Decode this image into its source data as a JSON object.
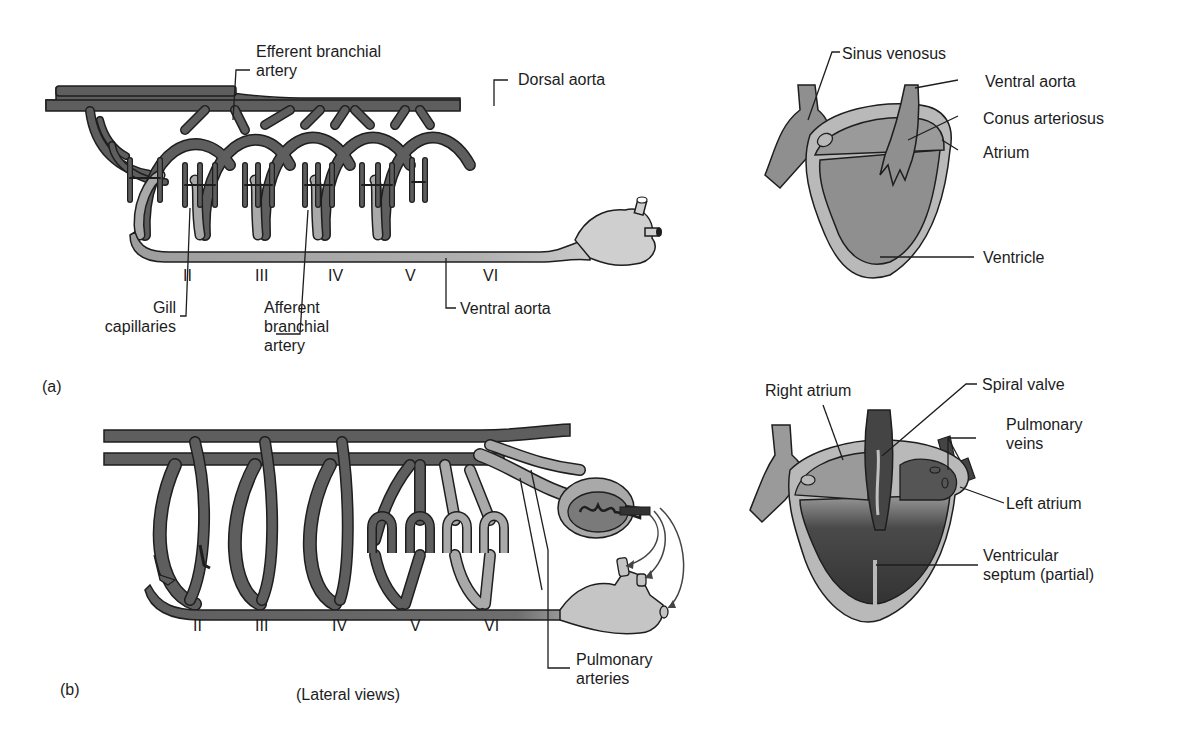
{
  "figure": {
    "caption": "(Lateral views)",
    "panels": [
      {
        "id": "a",
        "tag": "(a)",
        "arch_numerals": [
          "II",
          "III",
          "IV",
          "V",
          "VI"
        ],
        "arch_labels": {
          "efferent": "Efferent branchial artery",
          "efferent_line1": "Efferent branchial",
          "efferent_line2": "artery",
          "dorsal_aorta": "Dorsal aorta",
          "gill_line1": "Gill",
          "gill_line2": "capillaries",
          "afferent_line1": "Afferent",
          "afferent_line2": "branchial",
          "afferent_line3": "artery",
          "ventral_aorta": "Ventral aorta"
        },
        "heart_labels": {
          "sinus_venosus": "Sinus venosus",
          "ventral_aorta": "Ventral aorta",
          "conus_arteriosus": "Conus arteriosus",
          "atrium": "Atrium",
          "ventricle": "Ventricle"
        }
      },
      {
        "id": "b",
        "tag": "(b)",
        "arch_numerals": [
          "II",
          "III",
          "IV",
          "V",
          "VI"
        ],
        "arch_labels": {
          "pulmonary_arteries_line1": "Pulmonary",
          "pulmonary_arteries_line2": "arteries"
        },
        "heart_labels": {
          "right_atrium": "Right atrium",
          "spiral_valve": "Spiral valve",
          "pulmonary_veins_line1": "Pulmonary",
          "pulmonary_veins_line2": "veins",
          "left_atrium": "Left atrium",
          "ventricular_septum_line1": "Ventricular",
          "ventricular_septum_line2": "septum (partial)"
        }
      }
    ],
    "colors": {
      "vessel_dark": "#5e5e5e",
      "vessel_light": "#a9a9a9",
      "outline": "#1e1e1e",
      "heart_wall": "#b9b9b9",
      "heart_chamber": "#8f8f8f",
      "heart_dark": "#3f3f3f",
      "background": "#ffffff"
    }
  }
}
